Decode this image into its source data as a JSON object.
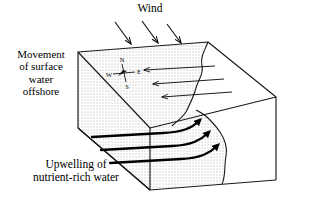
{
  "figure": {
    "kind": "block-diagram",
    "background_color": "#ffffff",
    "line_color": "#000000",
    "water_fill": "stipple-dots",
    "land_fill": "#ffffff"
  },
  "labels": {
    "wind": "Wind",
    "movement": "Movement\nof surface\nwater\noffshore",
    "movement_lines": [
      "Movement",
      "of surface",
      "water",
      "offshore"
    ],
    "upwelling": "Upwelling of\nnutrient-rich water",
    "upwelling_lines": [
      "Upwelling of",
      "nutrient-rich water"
    ]
  },
  "compass": {
    "north": "N",
    "south": "S",
    "east": "E",
    "west": "W"
  },
  "arrows": {
    "wind_arrows": {
      "count": 3,
      "direction": "down-right",
      "description": "wind blowing onto the sea surface from upper left"
    },
    "surface_arrows": {
      "count": 3,
      "direction": "left",
      "description": "surface water moving offshore away from the coast"
    },
    "upwelling_arrows": {
      "count": 3,
      "direction": "up-right curving",
      "description": "deep nutrient-rich water rising toward the coast"
    }
  },
  "geometry": {
    "top_apex": [
      208,
      42
    ],
    "left_top": [
      78,
      52
    ],
    "front_vertex": [
      150,
      128
    ],
    "right_top": [
      276,
      97
    ],
    "left_bottom": [
      78,
      128
    ],
    "front_bottom": [
      150,
      190
    ],
    "right_bottom": [
      276,
      180
    ]
  }
}
